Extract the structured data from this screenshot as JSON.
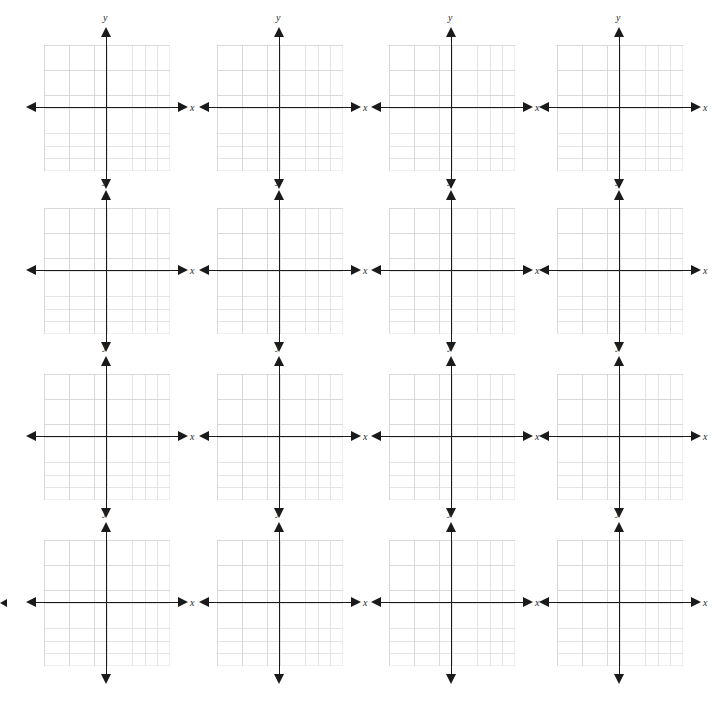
{
  "page": {
    "background_color": "#ffffff",
    "width": 722,
    "height": 701
  },
  "layout": {
    "type": "grid",
    "columns": 4,
    "rows": 4,
    "total_planes": 16,
    "column_centers_px": [
      107,
      280,
      452,
      620
    ],
    "row_centers_px": [
      108,
      271,
      437,
      603
    ]
  },
  "style": {
    "axis_color": "#1a1a1a",
    "grid_color": "#e3e3e5",
    "label_color": "#2b2b2b"
  },
  "plane_template": {
    "x_axis_label": "x",
    "y_axis_label": "y",
    "grid_cells_x": 10,
    "grid_cells_y": 10,
    "cell_size_px": 12.6,
    "origin_label": "",
    "tick_labels_x": [],
    "tick_labels_y": [],
    "arrowheads": [
      "left",
      "right",
      "up",
      "down"
    ]
  },
  "chart_data": {
    "type": "scatter",
    "subtitle": "",
    "xlabel": "x",
    "ylabel": "y",
    "xlim": [
      -5,
      5
    ],
    "ylim": [
      -5,
      5
    ],
    "grid": true,
    "legend": "none",
    "series": [],
    "x": [],
    "y": [],
    "annotations": []
  },
  "planes": [
    {
      "id": "plane-1",
      "row": 1,
      "col": 1,
      "cx": 107,
      "cy": 108,
      "x_axis_label": "x",
      "y_axis_label": "y"
    },
    {
      "id": "plane-2",
      "row": 1,
      "col": 2,
      "cx": 280,
      "cy": 108,
      "x_axis_label": "x",
      "y_axis_label": "y"
    },
    {
      "id": "plane-3",
      "row": 1,
      "col": 3,
      "cx": 452,
      "cy": 108,
      "x_axis_label": "x",
      "y_axis_label": "y"
    },
    {
      "id": "plane-4",
      "row": 1,
      "col": 4,
      "cx": 620,
      "cy": 108,
      "x_axis_label": "x",
      "y_axis_label": "y"
    },
    {
      "id": "plane-5",
      "row": 2,
      "col": 1,
      "cx": 107,
      "cy": 271,
      "x_axis_label": "x",
      "y_axis_label": "y"
    },
    {
      "id": "plane-6",
      "row": 2,
      "col": 2,
      "cx": 280,
      "cy": 271,
      "x_axis_label": "x",
      "y_axis_label": "y"
    },
    {
      "id": "plane-7",
      "row": 2,
      "col": 3,
      "cx": 452,
      "cy": 271,
      "x_axis_label": "x",
      "y_axis_label": "y"
    },
    {
      "id": "plane-8",
      "row": 2,
      "col": 4,
      "cx": 620,
      "cy": 271,
      "x_axis_label": "x",
      "y_axis_label": "y"
    },
    {
      "id": "plane-9",
      "row": 3,
      "col": 1,
      "cx": 107,
      "cy": 437,
      "x_axis_label": "x",
      "y_axis_label": "y"
    },
    {
      "id": "plane-10",
      "row": 3,
      "col": 2,
      "cx": 280,
      "cy": 437,
      "x_axis_label": "x",
      "y_axis_label": "y"
    },
    {
      "id": "plane-11",
      "row": 3,
      "col": 3,
      "cx": 452,
      "cy": 437,
      "x_axis_label": "x",
      "y_axis_label": "y"
    },
    {
      "id": "plane-12",
      "row": 3,
      "col": 4,
      "cx": 620,
      "cy": 437,
      "x_axis_label": "x",
      "y_axis_label": "y"
    },
    {
      "id": "plane-13",
      "row": 4,
      "col": 1,
      "cx": 107,
      "cy": 603,
      "x_axis_label": "x",
      "y_axis_label": "y"
    },
    {
      "id": "plane-14",
      "row": 4,
      "col": 2,
      "cx": 280,
      "cy": 603,
      "x_axis_label": "x",
      "y_axis_label": "y"
    },
    {
      "id": "plane-15",
      "row": 4,
      "col": 3,
      "cx": 452,
      "cy": 603,
      "x_axis_label": "x",
      "y_axis_label": "y"
    },
    {
      "id": "plane-16",
      "row": 4,
      "col": 4,
      "cx": 620,
      "cy": 603,
      "x_axis_label": "x",
      "y_axis_label": "y"
    }
  ],
  "edge_marks": [
    {
      "id": "edge-stub-left",
      "x": 0,
      "y": 599
    }
  ]
}
